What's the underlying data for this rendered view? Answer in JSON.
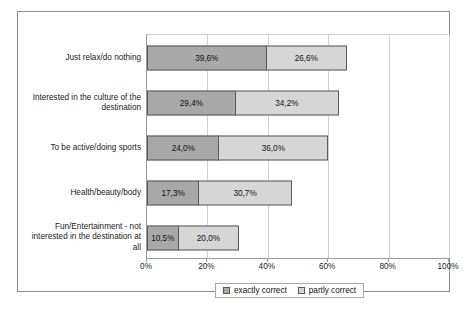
{
  "chart_data": {
    "type": "bar",
    "orientation": "horizontal",
    "stacked": true,
    "title": "",
    "xlabel": "",
    "ylabel": "",
    "xlim": [
      0,
      100
    ],
    "grid": true,
    "legend_position": "bottom",
    "tick_labels": [
      "0%",
      "20%",
      "40%",
      "60%",
      "80%",
      "100%"
    ],
    "tick_values": [
      0,
      20,
      40,
      60,
      80,
      100
    ],
    "categories": [
      "Just relax/do nothing",
      "Interested in the culture of the destination",
      "To be active/doing sports",
      "Health/beauty/body",
      "Fun/Entertainment - not interested in the destination at all"
    ],
    "series": [
      {
        "name": "exactly correct",
        "color": "#a8a8a8",
        "values": [
          39.6,
          29.4,
          24.0,
          17.3,
          10.5
        ],
        "labels": [
          "39,6%",
          "29,4%",
          "24,0%",
          "17,3%",
          "10,5%"
        ]
      },
      {
        "name": "partly correct",
        "color": "#d6d6d6",
        "values": [
          26.6,
          34.2,
          36.0,
          30.7,
          20.0
        ],
        "labels": [
          "26,6%",
          "34,2%",
          "36,0%",
          "30,7%",
          "20,0%"
        ]
      }
    ]
  },
  "legend": {
    "items": [
      {
        "label": "exactly correct"
      },
      {
        "label": "partly correct"
      }
    ]
  },
  "caption": {
    "text": ""
  }
}
